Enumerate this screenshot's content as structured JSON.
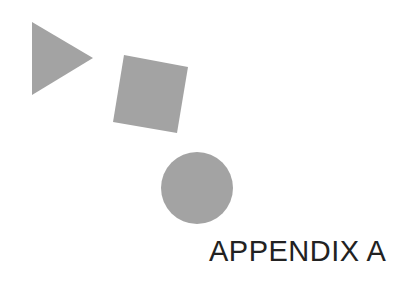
{
  "page": {
    "title": "APPENDIX A"
  },
  "shapes": {
    "triangle": {
      "type": "triangle",
      "points": "32,22 93,58 32,95",
      "fill": "#a3a3a3"
    },
    "square": {
      "type": "square",
      "points": "124,55 188,67 177,133 113,122",
      "fill": "#a3a3a3"
    },
    "circle": {
      "type": "circle",
      "cx": "197",
      "cy": "188",
      "r": "36",
      "fill": "#a3a3a3"
    }
  }
}
